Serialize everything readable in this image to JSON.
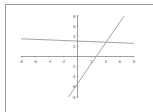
{
  "chart_data": {
    "type": "line",
    "title": "",
    "xlabel": "",
    "ylabel": "",
    "xlim": [
      -8,
      8
    ],
    "ylim": [
      -8,
      8
    ],
    "grid": false,
    "x_ticks": [
      -8,
      -6,
      -4,
      -2,
      2,
      4,
      6,
      8
    ],
    "x_tick_labels": [
      "-8",
      "-6",
      "-4",
      "-2",
      "2",
      "4",
      "6",
      "8"
    ],
    "y_ticks": [
      8,
      6,
      4,
      2,
      -2,
      -4,
      -6,
      -8
    ],
    "y_tick_labels": [
      "8",
      "6",
      "4",
      "2",
      "-2",
      "-4",
      "-6",
      "-8"
    ],
    "series": [
      {
        "name": "line-shallow",
        "color": "#999999",
        "x": [
          -8,
          8
        ],
        "y": [
          3.5,
          2.6
        ]
      },
      {
        "name": "line-steep",
        "color": "#999999",
        "x": [
          -1.3,
          6.6
        ],
        "y": [
          -8,
          8
        ]
      }
    ]
  },
  "colors": {
    "axis": "#888888",
    "frame": "#9a9a9a"
  }
}
